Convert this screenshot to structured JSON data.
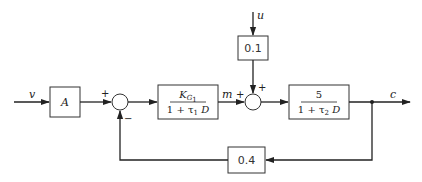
{
  "diagram": {
    "type": "block-diagram",
    "signals": {
      "input_v": "v",
      "disturbance_u": "u",
      "intermediate_m": "m",
      "output_c": "c"
    },
    "blocks": {
      "gain_a": {
        "label": "A"
      },
      "controller": {
        "numerator_main": "K",
        "numerator_sub": "G",
        "numerator_subsub": "1",
        "denominator_prefix": "1 + τ",
        "denominator_sub": "1",
        "denominator_suffix": " D"
      },
      "plant": {
        "numerator": "5",
        "denominator_prefix": "1 + τ",
        "denominator_sub": "2",
        "denominator_suffix": " D"
      },
      "disturbance_gain": {
        "label": "0.1"
      },
      "feedback_gain": {
        "label": "0.4"
      }
    },
    "summing_junctions": {
      "sum1": {
        "plus_sign": "+",
        "minus_sign": "−"
      },
      "sum2": {
        "plus_left": "+",
        "plus_top": "+"
      }
    },
    "colors": {
      "line": "#222222",
      "box_border": "#333333",
      "background": "#ffffff"
    }
  }
}
